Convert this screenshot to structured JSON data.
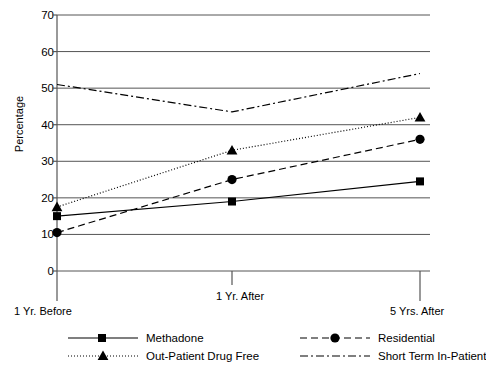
{
  "chart_data": {
    "type": "line",
    "title": "",
    "xlabel": "",
    "ylabel": "Percentage",
    "categories": [
      "1 Yr. Before",
      "1 Yr. After",
      "5 Yrs. After"
    ],
    "ylim": [
      0,
      70
    ],
    "yticks": [
      0,
      10,
      20,
      30,
      40,
      50,
      60,
      70
    ],
    "grid": true,
    "legend_position": "bottom",
    "series": [
      {
        "name": "Methadone",
        "values": [
          15,
          19,
          24.5
        ],
        "marker": "square",
        "linestyle": "solid",
        "color": "#000000"
      },
      {
        "name": "Residential",
        "values": [
          10.5,
          25,
          36
        ],
        "marker": "circle",
        "linestyle": "dashed",
        "color": "#000000"
      },
      {
        "name": "Out-Patient Drug Free",
        "values": [
          17.5,
          33,
          42
        ],
        "marker": "triangle",
        "linestyle": "dotted",
        "color": "#000000"
      },
      {
        "name": "Short Term In-Patient",
        "values": [
          51,
          43.5,
          54
        ],
        "marker": "none",
        "linestyle": "dashdot",
        "color": "#000000"
      }
    ]
  },
  "axis": {
    "y_title": "Percentage",
    "y_tick_labels": [
      "70",
      "60",
      "50",
      "40",
      "30",
      "20",
      "10",
      "0"
    ],
    "x_tick_labels": [
      "1 Yr. Before",
      "1 Yr. After",
      "5 Yrs. After"
    ]
  },
  "legend": {
    "entries": [
      {
        "label": "Methadone"
      },
      {
        "label": "Residential"
      },
      {
        "label": "Out-Patient Drug Free"
      },
      {
        "label": "Short Term In-Patient"
      }
    ]
  }
}
